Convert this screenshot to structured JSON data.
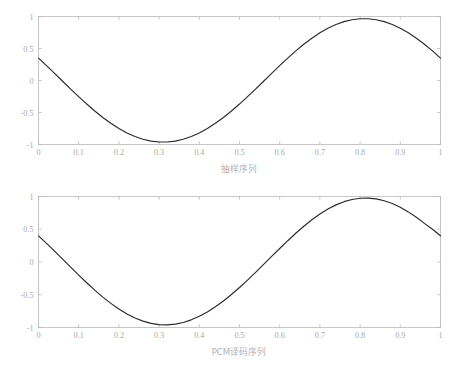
{
  "figure": {
    "background_color": "#ffffff",
    "axis_color": "#b9b9bc",
    "curve_color": "#2a2a2a",
    "label_color": "#a8a8ad"
  },
  "chart_data": [
    {
      "type": "line",
      "id": "sampling-sequence",
      "title": "",
      "xlabel": "抽样序列",
      "ylabel": "",
      "xlim": [
        0,
        1
      ],
      "ylim": [
        -1,
        1
      ],
      "grid": false,
      "legend": null,
      "xticks": [
        0,
        0.1,
        0.2,
        0.3,
        0.4,
        0.5,
        0.6,
        0.7,
        0.8,
        0.9,
        1
      ],
      "xticklabels": [
        "0",
        "0.1",
        "0.2",
        "0.3",
        "0.4",
        "0.5",
        "0.6",
        "0.7",
        "0.8",
        "0.9",
        "1"
      ],
      "yticks": [
        -1,
        -0.5,
        0,
        0.5,
        1
      ],
      "yticklabels": [
        "-1",
        "-0.5",
        "0",
        "0.5",
        "1"
      ],
      "series": [
        {
          "name": "sampled sine",
          "formula": "cos(2*pi*(x + 0.195))",
          "x": [
            0,
            0.02,
            0.04,
            0.06,
            0.08,
            0.1,
            0.12,
            0.14,
            0.16,
            0.18,
            0.2,
            0.22,
            0.24,
            0.26,
            0.28,
            0.3,
            0.32,
            0.34,
            0.36,
            0.38,
            0.4,
            0.42,
            0.44,
            0.46,
            0.48,
            0.5,
            0.52,
            0.54,
            0.56,
            0.58,
            0.6,
            0.62,
            0.64,
            0.66,
            0.68,
            0.7,
            0.72,
            0.74,
            0.76,
            0.78,
            0.8,
            0.82,
            0.84,
            0.86,
            0.88,
            0.9,
            0.92,
            0.94,
            0.96,
            0.98,
            1
          ],
          "values": [
            0.35,
            0.232,
            0.111,
            -0.012,
            -0.134,
            -0.253,
            -0.368,
            -0.477,
            -0.578,
            -0.669,
            -0.75,
            -0.819,
            -0.875,
            -0.918,
            -0.947,
            -0.961,
            -0.961,
            -0.947,
            -0.918,
            -0.875,
            -0.819,
            -0.75,
            -0.669,
            -0.578,
            -0.477,
            -0.368,
            -0.253,
            -0.134,
            -0.012,
            0.111,
            0.232,
            0.35,
            0.462,
            0.566,
            0.661,
            0.745,
            0.817,
            0.876,
            0.92,
            0.95,
            0.965,
            0.965,
            0.95,
            0.92,
            0.876,
            0.817,
            0.745,
            0.661,
            0.566,
            0.462,
            0.35
          ]
        }
      ],
      "annotations": {
        "peak_x": 0.81,
        "peak_y": 1,
        "trough_x": 0.3,
        "trough_y": -1,
        "start_y": 0.35,
        "end_y": 0.35
      }
    },
    {
      "type": "line",
      "id": "pcm-decoded-sequence",
      "title": "",
      "xlabel": "PCM译码序列",
      "ylabel": "",
      "xlim": [
        0,
        1
      ],
      "ylim": [
        -1,
        1
      ],
      "grid": false,
      "legend": null,
      "xticks": [
        0,
        0.1,
        0.2,
        0.3,
        0.4,
        0.5,
        0.6,
        0.7,
        0.8,
        0.9,
        1
      ],
      "xticklabels": [
        "0",
        "0.1",
        "0.2",
        "0.3",
        "0.4",
        "0.5",
        "0.6",
        "0.7",
        "0.8",
        "0.9",
        "1"
      ],
      "yticks": [
        -1,
        -0.5,
        0,
        0.5,
        1
      ],
      "yticklabels": [
        "-1",
        "-0.5",
        "0",
        "0.5",
        "1"
      ],
      "series": [
        {
          "name": "PCM decoded sine",
          "formula": "cos(2*pi*(x + 0.19))",
          "x": [
            0,
            0.02,
            0.04,
            0.06,
            0.08,
            0.1,
            0.12,
            0.14,
            0.16,
            0.18,
            0.2,
            0.22,
            0.24,
            0.26,
            0.28,
            0.3,
            0.32,
            0.34,
            0.36,
            0.38,
            0.4,
            0.42,
            0.44,
            0.46,
            0.48,
            0.5,
            0.52,
            0.54,
            0.56,
            0.58,
            0.6,
            0.62,
            0.64,
            0.66,
            0.68,
            0.7,
            0.72,
            0.74,
            0.76,
            0.78,
            0.8,
            0.82,
            0.84,
            0.86,
            0.88,
            0.9,
            0.92,
            0.94,
            0.96,
            0.98,
            1
          ],
          "values": [
            0.4,
            0.285,
            0.166,
            0.044,
            -0.079,
            -0.2,
            -0.317,
            -0.43,
            -0.536,
            -0.632,
            -0.718,
            -0.793,
            -0.855,
            -0.903,
            -0.937,
            -0.956,
            -0.96,
            -0.949,
            -0.923,
            -0.883,
            -0.829,
            -0.762,
            -0.684,
            -0.595,
            -0.496,
            -0.389,
            -0.276,
            -0.158,
            -0.037,
            0.085,
            0.206,
            0.325,
            0.439,
            0.546,
            0.645,
            0.733,
            0.809,
            0.872,
            0.921,
            0.954,
            0.973,
            0.976,
            0.963,
            0.935,
            0.892,
            0.835,
            0.765,
            0.683,
            0.59,
            0.499,
            0.4
          ]
        }
      ],
      "annotations": {
        "peak_x": 0.81,
        "peak_y": 1,
        "trough_x": 0.3,
        "trough_y": -1,
        "start_y": 0.4,
        "end_y": 0.4
      }
    }
  ]
}
